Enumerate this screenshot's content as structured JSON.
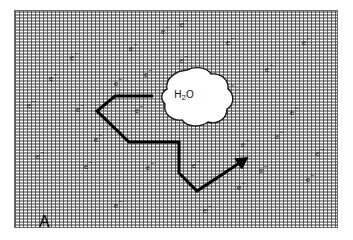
{
  "figure": {
    "panel_label": "A",
    "width": 353,
    "height": 240
  },
  "frame": {
    "x": 14,
    "y": 10,
    "width": 324,
    "height": 218,
    "border_color": "#6b6b6b",
    "fill_description": "stippled-grey-medium"
  },
  "water_blob": {
    "label_h": "H",
    "label_sub": "2",
    "label_o": "O",
    "label_full": "H2O",
    "center_x": 183,
    "center_y": 92,
    "outline_color": "#111111",
    "fill_color": "#ffffff"
  },
  "track": {
    "name": "electron-track",
    "stroke_color": "#000000",
    "stroke_width": 3,
    "arrow_head": true,
    "points": [
      [
        152,
        95
      ],
      [
        114,
        95
      ],
      [
        96,
        110
      ],
      [
        128,
        141
      ],
      [
        178,
        141
      ],
      [
        178,
        172
      ],
      [
        196,
        190
      ],
      [
        240,
        161
      ]
    ]
  },
  "electrons": {
    "symbol": "e",
    "charge": "−",
    "count": 30,
    "positions": [
      [
        73,
        57
      ],
      [
        132,
        48
      ],
      [
        30,
        105
      ],
      [
        79,
        109
      ],
      [
        117,
        83
      ],
      [
        138,
        110
      ],
      [
        183,
        24
      ],
      [
        229,
        42
      ],
      [
        183,
        60
      ],
      [
        268,
        69
      ],
      [
        229,
        89
      ],
      [
        219,
        112
      ],
      [
        293,
        112
      ],
      [
        97,
        139
      ],
      [
        39,
        156
      ],
      [
        87,
        166
      ],
      [
        149,
        167
      ],
      [
        117,
        205
      ],
      [
        195,
        165
      ],
      [
        244,
        144
      ],
      [
        319,
        153
      ],
      [
        262,
        170
      ],
      [
        240,
        187
      ],
      [
        309,
        179
      ],
      [
        206,
        210
      ],
      [
        164,
        31
      ],
      [
        305,
        42
      ],
      [
        52,
        78
      ],
      [
        278,
        136
      ],
      [
        147,
        74
      ]
    ]
  },
  "colors": {
    "stipple": "#464646",
    "text": "#222222",
    "track": "#000000",
    "background": "#ffffff"
  }
}
